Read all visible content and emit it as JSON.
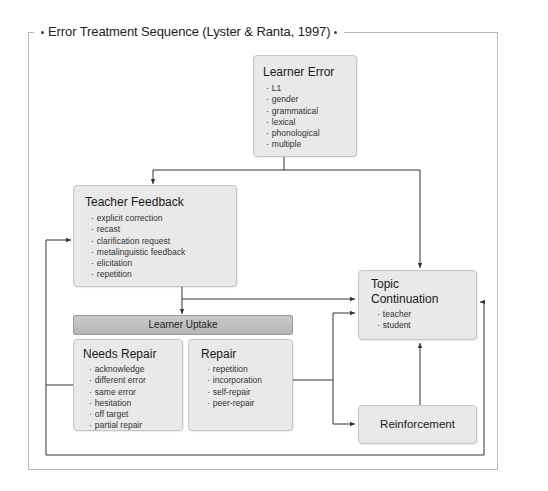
{
  "diagram": {
    "title": "Error Treatment Sequence (Lyster & Ranta, 1997)",
    "nodes": {
      "learner_error": {
        "title": "Learner Error",
        "items": [
          "L1",
          "gender",
          "grammatical",
          "lexical",
          "phonological",
          "multiple"
        ]
      },
      "teacher_feedback": {
        "title": "Teacher Feedback",
        "items": [
          "explicit correction",
          "recast",
          "clarification request",
          "metalinguistic feedback",
          "elicitation",
          "repetition"
        ]
      },
      "learner_uptake": {
        "title": "Learner Uptake"
      },
      "needs_repair": {
        "title": "Needs Repair",
        "items": [
          "acknowledge",
          "different error",
          "same error",
          "hesitation",
          "off target",
          "partial repair"
        ]
      },
      "repair": {
        "title": "Repair",
        "items": [
          "repetition",
          "incorporation",
          "self-repair",
          "peer-repair"
        ]
      },
      "topic_continuation": {
        "title_line1": "Topic",
        "title_line2": "Continuation",
        "items": [
          "teacher",
          "student"
        ]
      },
      "reinforcement": {
        "title": "Reinforcement"
      }
    },
    "edges": [
      {
        "from": "Learner Error",
        "to": "Teacher Feedback"
      },
      {
        "from": "Learner Error",
        "to": "Topic Continuation"
      },
      {
        "from": "Teacher Feedback",
        "to": "Learner Uptake"
      },
      {
        "from": "Teacher Feedback",
        "to": "Topic Continuation"
      },
      {
        "from": "Needs Repair",
        "to": "Teacher Feedback"
      },
      {
        "from": "Repair",
        "to": "Topic Continuation"
      },
      {
        "from": "Repair",
        "to": "Reinforcement"
      },
      {
        "from": "Reinforcement",
        "to": "Topic Continuation"
      },
      {
        "from": "Needs Repair",
        "to": "Topic Continuation"
      }
    ],
    "colors": {
      "box_fill": "#e9e9e9",
      "box_border": "#c6c6c6",
      "uptake_fill": "#bfbfbf",
      "line": "#333333",
      "frame": "#b8b8b8"
    }
  }
}
